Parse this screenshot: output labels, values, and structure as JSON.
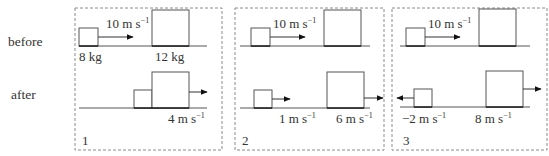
{
  "row_labels": {
    "before": "before",
    "after": "after"
  },
  "units": {
    "velocity_base": "m s",
    "velocity_exp": "−1"
  },
  "panels": [
    {
      "number": "1",
      "before": {
        "small_mass": "8 kg",
        "large_mass": "12 kg",
        "small_velocity": "10"
      },
      "after": {
        "combined_velocity": "4",
        "note": "blocks stick together"
      }
    },
    {
      "number": "2",
      "before": {
        "small_velocity": "10"
      },
      "after": {
        "small_velocity": "1",
        "large_velocity": "6"
      }
    },
    {
      "number": "3",
      "before": {
        "small_velocity": "10"
      },
      "after": {
        "small_velocity": "−2",
        "large_velocity": "8"
      }
    }
  ]
}
